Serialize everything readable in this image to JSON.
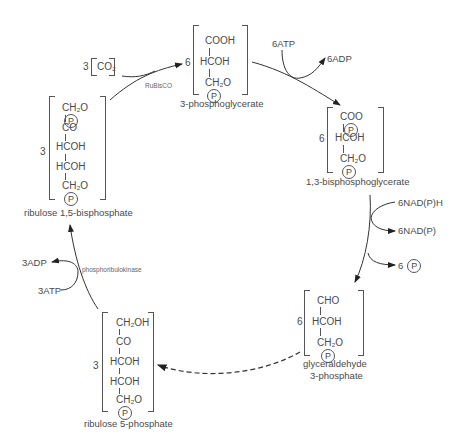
{
  "molecules": {
    "pga": {
      "name": "3-phosphoglycerate",
      "coefficient": "6",
      "lines": [
        "COOH",
        "HCOH",
        "CH₂O"
      ],
      "phosphate": "P"
    },
    "bpga": {
      "name": "1,3-bisphosphoglycerate",
      "coefficient": "6",
      "lines": [
        "COO",
        "HCOH",
        "CH₂O"
      ],
      "phosphate": "P"
    },
    "g3p": {
      "name_line1": "glyceraldehyde",
      "name_line2": "3-phosphate",
      "coefficient": "6",
      "lines": [
        "CHO",
        "HCOH",
        "CH₂O"
      ],
      "phosphate": "P"
    },
    "ru5p": {
      "name": "ribulose 5-phosphate",
      "coefficient": "3",
      "lines": [
        "CH₂OH",
        "CO",
        "HCOH",
        "HCOH",
        "CH₂O"
      ],
      "phosphate": "P"
    },
    "rubp": {
      "name": "ribulose 1,5-bisphosphate",
      "coefficient": "3",
      "lines": [
        "CH₂O",
        "CO",
        "HCOH",
        "HCOH",
        "CH₂O"
      ],
      "phosphate": "P"
    },
    "co2": {
      "coefficient": "3",
      "formula": "CO₂"
    }
  },
  "enzymes": {
    "rubisco": "RuBisCO",
    "prk": "phosphoribulokinase"
  },
  "cofactors": {
    "atp_in": "6ATP",
    "adp_out": "6ADP",
    "nadph_in": "6NAD(P)H",
    "nadp_out": "6NAD(P)",
    "pi_coef": "6",
    "pi": "P",
    "atp3_in": "3ATP",
    "adp3_out": "3ADP"
  },
  "colors": {
    "ink": "#4a4a4a",
    "line": "#333333",
    "background": "#ffffff"
  }
}
